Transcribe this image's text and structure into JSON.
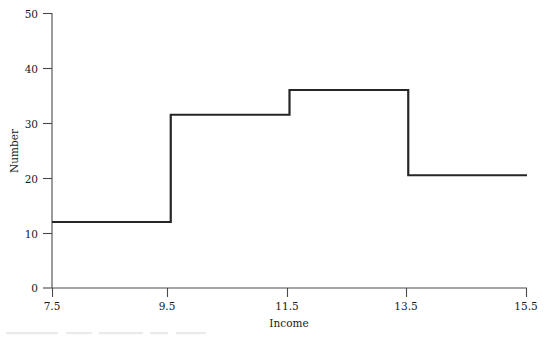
{
  "chart_data": {
    "type": "line",
    "subtype": "step-histogram",
    "title": "",
    "xlabel": "Income",
    "ylabel": "Number",
    "xlim": [
      7.5,
      15.5
    ],
    "ylim": [
      0,
      50
    ],
    "xticks": [
      7.5,
      9.5,
      11.5,
      13.5,
      15.5
    ],
    "xtick_labels": [
      "7.5",
      "9.5",
      "11.5",
      "13.5",
      "15.5"
    ],
    "yticks": [
      0,
      10,
      20,
      30,
      40,
      50
    ],
    "ytick_labels": [
      "0",
      "10",
      "20",
      "30",
      "40",
      "50"
    ],
    "grid": false,
    "legend": null,
    "bin_edges": [
      7.5,
      9.5,
      11.5,
      13.5,
      15.5
    ],
    "values": [
      12,
      31.5,
      36,
      20.5
    ],
    "bins": [
      {
        "x_start": 7.5,
        "x_end": 9.5,
        "value": 12
      },
      {
        "x_start": 9.5,
        "x_end": 11.5,
        "value": 31.5
      },
      {
        "x_start": 11.5,
        "x_end": 13.5,
        "value": 36
      },
      {
        "x_start": 13.5,
        "x_end": 15.5,
        "value": 20.5
      }
    ],
    "series": [
      {
        "name": "Number",
        "x": [
          7.5,
          9.5,
          9.5,
          11.5,
          11.5,
          13.5,
          13.5,
          15.5
        ],
        "y": [
          12,
          12,
          31.5,
          31.5,
          36,
          36,
          20.5,
          20.5
        ],
        "color": "#262626"
      }
    ],
    "colors": {
      "line": "#262626",
      "axis": "#4a4a4a",
      "text": "#1a1a1a",
      "background": "#ffffff"
    }
  }
}
